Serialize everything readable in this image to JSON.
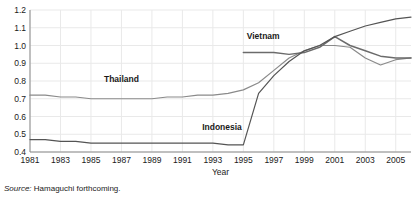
{
  "source": {
    "lead": "Source:",
    "text": " Hamaguchi forthcoming."
  },
  "axes": {
    "xlabel": "Year",
    "ylabel": ""
  },
  "labels": {
    "vietnam": "Vietnam",
    "thailand": "Thailand",
    "indonesia": "Indonesia"
  },
  "colors": {
    "vietnam": "#6b6b6b",
    "thailand": "#8a8a8a",
    "indonesia": "#545454",
    "grid": "#e9e9e9",
    "axis": "#8a8a8a",
    "text": "#1a1a1a"
  },
  "chart_data": {
    "type": "line",
    "title": "",
    "xlabel": "Year",
    "ylabel": "",
    "xlim": [
      1981,
      2006
    ],
    "ylim": [
      0.4,
      1.2
    ],
    "xticks": [
      1981,
      1983,
      1985,
      1987,
      1989,
      1991,
      1993,
      1995,
      1997,
      1999,
      2001,
      2003,
      2005
    ],
    "yticks": [
      0.4,
      0.5,
      0.6,
      0.7,
      0.8,
      0.9,
      1.0,
      1.1,
      1.2
    ],
    "ytick_labels": [
      "0.4",
      "0.5",
      "0.6",
      "0.7",
      "0.8",
      "0.9",
      "1.0",
      "1.1",
      "1.2"
    ],
    "xtick_labels": [
      "1981",
      "1983",
      "1985",
      "1987",
      "1989",
      "1991",
      "1993",
      "1995",
      "1997",
      "1999",
      "2001",
      "2003",
      "2005"
    ],
    "grid": true,
    "legend": "inline-labels",
    "x": [
      1981,
      1982,
      1983,
      1984,
      1985,
      1986,
      1987,
      1988,
      1989,
      1990,
      1991,
      1992,
      1993,
      1994,
      1995,
      1996,
      1997,
      1998,
      1999,
      2000,
      2001,
      2002,
      2003,
      2004,
      2005,
      2006
    ],
    "series": [
      {
        "name": "Thailand",
        "values": [
          0.72,
          0.72,
          0.71,
          0.71,
          0.7,
          0.7,
          0.7,
          0.7,
          0.7,
          0.71,
          0.71,
          0.72,
          0.72,
          0.73,
          0.75,
          0.79,
          0.86,
          0.93,
          0.97,
          1.0,
          1.0,
          0.99,
          0.93,
          0.89,
          0.92,
          0.93
        ]
      },
      {
        "name": "Vietnam",
        "values": [
          null,
          null,
          null,
          null,
          null,
          null,
          null,
          null,
          null,
          null,
          null,
          null,
          null,
          null,
          0.96,
          0.96,
          0.96,
          0.95,
          0.96,
          0.99,
          1.05,
          1.0,
          0.97,
          0.94,
          0.93,
          0.93
        ]
      },
      {
        "name": "Indonesia",
        "values": [
          0.47,
          0.47,
          0.46,
          0.46,
          0.45,
          0.45,
          0.45,
          0.45,
          0.45,
          0.45,
          0.45,
          0.45,
          0.45,
          0.44,
          0.44,
          0.73,
          0.83,
          0.91,
          0.97,
          1.0,
          1.05,
          1.08,
          1.11,
          1.13,
          1.15,
          1.16
        ]
      }
    ],
    "annotations": [
      {
        "text": "Vietnam",
        "x": 1996.3,
        "y": 1.035
      },
      {
        "text": "Thailand",
        "x": 1987.0,
        "y": 0.795
      },
      {
        "text": "Indonesia",
        "x": 1993.6,
        "y": 0.525
      }
    ]
  }
}
